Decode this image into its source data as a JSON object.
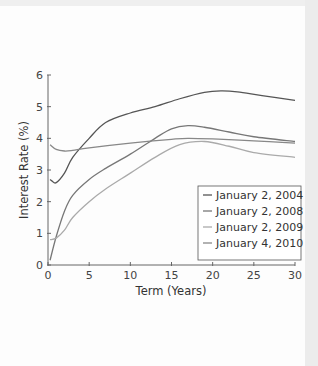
{
  "chart_data": {
    "type": "line",
    "title": "",
    "xlabel": "Term (Years)",
    "ylabel": "Interest Rate (%)",
    "xlim": [
      0,
      30
    ],
    "ylim": [
      0,
      6
    ],
    "xticks": [
      0,
      5,
      10,
      15,
      20,
      25,
      30
    ],
    "yticks": [
      0,
      1,
      2,
      3,
      4,
      5,
      6
    ],
    "grid": false,
    "legend_position": "lower right",
    "series": [
      {
        "name": "January 2, 2004",
        "color": "#555555",
        "x": [
          0.25,
          0.5,
          1,
          2,
          3,
          5,
          7,
          10,
          13,
          16,
          19,
          21,
          23,
          26,
          30
        ],
        "y": [
          2.7,
          2.65,
          2.6,
          2.9,
          3.4,
          4.0,
          4.5,
          4.8,
          5.0,
          5.25,
          5.45,
          5.5,
          5.47,
          5.35,
          5.2
        ]
      },
      {
        "name": "January 2, 2008",
        "color": "#777777",
        "x": [
          0.25,
          1,
          2,
          3,
          5,
          7,
          10,
          13,
          15,
          17,
          19,
          22,
          25,
          30
        ],
        "y": [
          0.15,
          0.9,
          1.7,
          2.2,
          2.7,
          3.05,
          3.5,
          4.0,
          4.3,
          4.4,
          4.35,
          4.2,
          4.05,
          3.9
        ]
      },
      {
        "name": "January 2, 2009",
        "color": "#aaaaaa",
        "x": [
          0.25,
          1,
          2,
          3,
          5,
          7,
          10,
          13,
          16,
          19,
          22,
          25,
          30
        ],
        "y": [
          0.8,
          0.85,
          1.1,
          1.5,
          2.0,
          2.4,
          2.9,
          3.4,
          3.8,
          3.9,
          3.75,
          3.55,
          3.4
        ]
      },
      {
        "name": "January 4, 2010",
        "color": "#888888",
        "x": [
          0.25,
          1,
          2,
          3,
          5,
          10,
          15,
          17,
          20,
          25,
          30
        ],
        "y": [
          3.8,
          3.65,
          3.6,
          3.62,
          3.7,
          3.85,
          3.97,
          4.0,
          3.98,
          3.92,
          3.85
        ]
      }
    ]
  }
}
